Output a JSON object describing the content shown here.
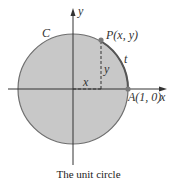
{
  "diagram": {
    "caption": "The unit circle",
    "labels": {
      "curve": "C",
      "y_axis": "y",
      "x_axis": "x",
      "point_p": "P(x, y)",
      "arc": "t",
      "segment_y": "y",
      "segment_x": "x",
      "point_a": "A(1, 0)"
    },
    "colors": {
      "circle_fill": "#c8c8c8",
      "circle_stroke": "#6e6e6e",
      "arc_highlight": "#555555",
      "axis": "#333333",
      "point": "#7a7a7a",
      "dashed": "#333333"
    },
    "geometry": {
      "center": [
        73,
        89
      ],
      "radius": 55,
      "point_p": [
        101,
        39
      ],
      "point_a": [
        128,
        89
      ]
    }
  }
}
